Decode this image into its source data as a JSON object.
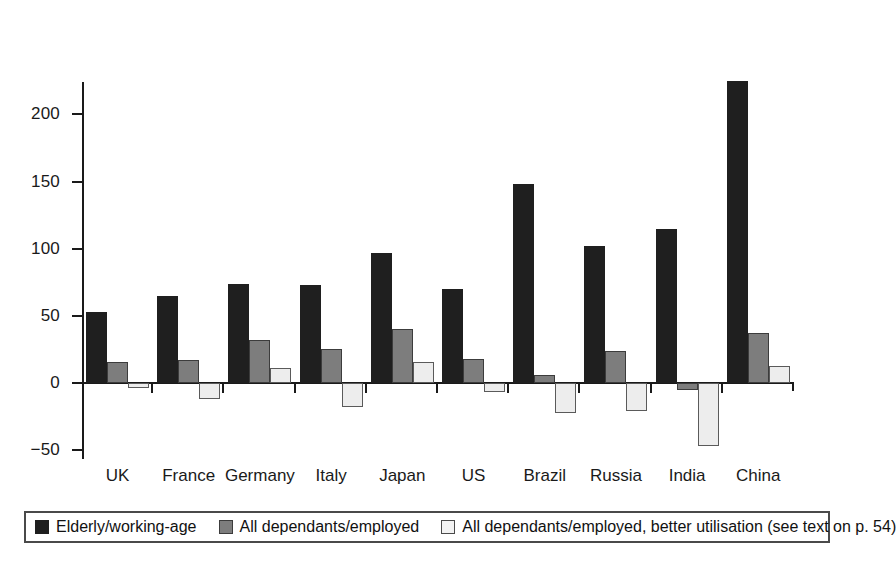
{
  "chart_data": {
    "type": "bar",
    "title": "",
    "subtitle": "",
    "xlabel": "",
    "ylabel": "",
    "ylim": [
      -50,
      230
    ],
    "yticks": [
      -50,
      0,
      50,
      100,
      150,
      200
    ],
    "ytick_labels": [
      "−50",
      "0",
      "50",
      "100",
      "150",
      "200"
    ],
    "grid": false,
    "legend_position": "bottom",
    "categories": [
      "UK",
      "France",
      "Germany",
      "Italy",
      "Japan",
      "US",
      "Brazil",
      "Russia",
      "India",
      "China"
    ],
    "series": [
      {
        "name": "Elderly/working-age",
        "color": "#1f1f1f",
        "values": [
          53,
          65,
          74,
          73,
          97,
          70,
          148,
          102,
          115,
          225
        ]
      },
      {
        "name": "All dependants/employed",
        "color": "#7d7d7d",
        "values": [
          16,
          17,
          32,
          25,
          40,
          18,
          6,
          24,
          -5,
          37
        ]
      },
      {
        "name": "All dependants/employed, better utilisation (see text on p. 54)",
        "color": "#ededed",
        "values": [
          -4,
          -12,
          11,
          -18,
          16,
          -7,
          -22,
          -21,
          -47,
          13
        ]
      }
    ]
  },
  "legend": {
    "items": [
      {
        "label": "Elderly/working-age",
        "swatch": "dark-swatch"
      },
      {
        "label": "All dependants/employed",
        "swatch": "gray-swatch"
      },
      {
        "label": "All dependants/employed, better utilisation (see text on p. 54)",
        "swatch": "light-swatch"
      }
    ]
  },
  "colors": {
    "series_dark": "#1f1f1f",
    "series_gray": "#7d7d7d",
    "series_light": "#ededed",
    "axis": "#1a1a1a",
    "background": "#ffffff"
  }
}
